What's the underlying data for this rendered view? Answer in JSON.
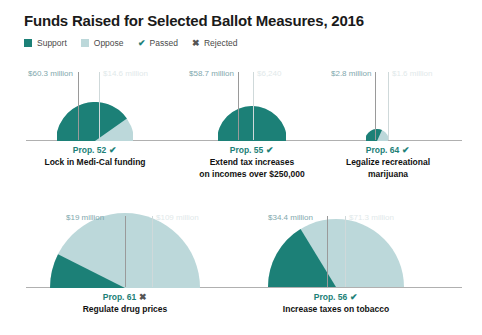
{
  "title": "Funds Raised for Selected Ballot Measures, 2016",
  "legend": {
    "items": [
      {
        "label": "Support",
        "type": "swatch",
        "color": "#1c8077"
      },
      {
        "label": "Oppose",
        "type": "swatch",
        "color": "#bcd8da"
      },
      {
        "label": "Passed",
        "type": "glyph",
        "glyph": "✔",
        "icon": "check-icon"
      },
      {
        "label": "Rejected",
        "type": "glyph",
        "glyph": "✖",
        "icon": "x-icon"
      }
    ]
  },
  "colors": {
    "support": "#1c8077",
    "oppose": "#bcd8da",
    "baseline": "#b0b0b0",
    "leader": "#9a9a9a",
    "support_label": "#7fa8ad",
    "oppose_label": "#dfe9ea",
    "prop_text": "#1c8077"
  },
  "chart_data": {
    "type": "pie",
    "title": "Funds Raised for Selected Ballot Measures, 2016",
    "subtype": "semicircle-halfpie, radius scaled by total funds raised",
    "legend_position": "top-left",
    "series": [
      {
        "name": "Support",
        "color": "#1c8077"
      },
      {
        "name": "Oppose",
        "color": "#bcd8da"
      }
    ],
    "categories": [
      "Prop. 52",
      "Prop. 55",
      "Prop. 64",
      "Prop. 61",
      "Prop. 56"
    ],
    "units": "US dollars",
    "items": [
      {
        "prop": "Prop. 52",
        "description": "Lock in Medi-Cal funding",
        "outcome": "Passed",
        "outcome_glyph": "✔",
        "support_label": "$60.3 million",
        "oppose_label": "$14.6 million",
        "support_value": 60300000,
        "oppose_value": 14600000,
        "total_value": 74900000
      },
      {
        "prop": "Prop. 55",
        "description": "Extend tax increases on incomes over $250,000",
        "outcome": "Passed",
        "outcome_glyph": "✔",
        "support_label": "$58.7 million",
        "oppose_label": "$6,240",
        "support_value": 58700000,
        "oppose_value": 6240,
        "total_value": 58706240
      },
      {
        "prop": "Prop. 64",
        "description": "Legalize recreational marijuana",
        "outcome": "Passed",
        "outcome_glyph": "✔",
        "support_label": "$2.8 million",
        "oppose_label": "$1.6 million",
        "support_value": 2800000,
        "oppose_value": 1600000,
        "total_value": 4400000
      },
      {
        "prop": "Prop. 61",
        "description": "Regulate drug prices",
        "outcome": "Rejected",
        "outcome_glyph": "✖",
        "support_label": "$19 million",
        "oppose_label": "$109 million",
        "support_value": 19000000,
        "oppose_value": 109000000,
        "total_value": 128000000
      },
      {
        "prop": "Prop. 56",
        "description": "Increase taxes on tobacco",
        "outcome": "Passed",
        "outcome_glyph": "✔",
        "support_label": "$34.4 million",
        "oppose_label": "$71.3 million",
        "support_value": 34400000,
        "oppose_value": 71300000,
        "total_value": 105700000
      }
    ]
  },
  "rows": {
    "row1": [
      "Prop. 52",
      "Prop. 55",
      "Prop. 64"
    ],
    "row2": [
      "Prop. 61",
      "Prop. 56"
    ]
  },
  "captions": {
    "p52_line1": "Lock in Medi-Cal funding",
    "p52_line2": "",
    "p55_line1": "Extend tax increases",
    "p55_line2": "on incomes over $250,000",
    "p64_line1": "Legalize recreational",
    "p64_line2": "marijuana",
    "p61_line1": "Regulate drug prices",
    "p61_line2": "",
    "p56_line1": "Increase taxes on tobacco",
    "p56_line2": ""
  }
}
